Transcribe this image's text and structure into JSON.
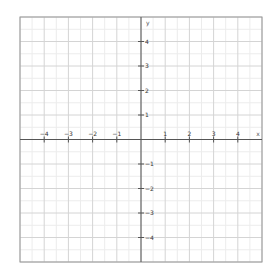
{
  "chart_data": {
    "type": "coordinate-grid",
    "title": "",
    "xlabel": "x",
    "ylabel": "y",
    "xlim": [
      -5,
      5
    ],
    "ylim": [
      -5,
      5
    ],
    "grid": true,
    "major_step": 1,
    "minor_step": 0.5,
    "x_ticks": [
      -4,
      -3,
      -2,
      -1,
      1,
      2,
      3,
      4
    ],
    "y_ticks": [
      4,
      3,
      2,
      1,
      -1,
      -2,
      -3,
      -4
    ],
    "x_tick_labels": [
      "−4",
      "−3",
      "−2",
      "−1",
      "1",
      "2",
      "3",
      "4"
    ],
    "y_tick_labels": [
      "4",
      "3",
      "2",
      "1",
      "−1",
      "−2",
      "−3",
      "−4"
    ],
    "series": [],
    "legend": null
  },
  "layout": {
    "plot_left": 20,
    "plot_top": 17,
    "plot_right": 262,
    "plot_bottom": 262,
    "colors": {
      "axis": "#555555",
      "border": "#999999",
      "major_grid": "#d4d4d4",
      "minor_grid": "#ececec",
      "text": "#333333"
    }
  }
}
